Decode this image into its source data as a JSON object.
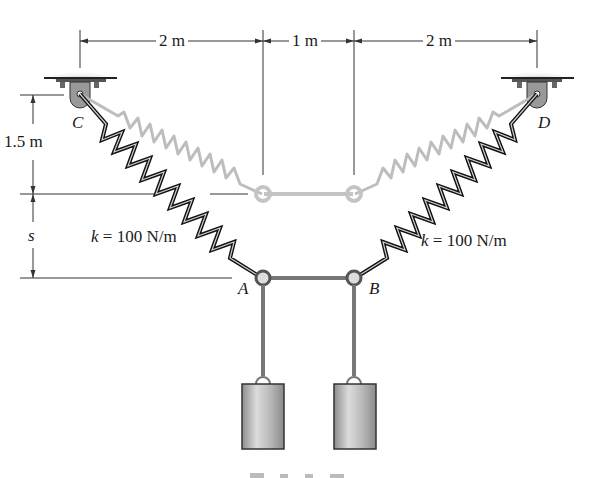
{
  "figure": {
    "dimensions": {
      "top_left": "2 m",
      "top_middle": "1 m",
      "top_right": "2 m",
      "left_vertical_upper": "1.5 m",
      "left_vertical_lower": "s"
    },
    "supports": {
      "left": "C",
      "right": "D"
    },
    "joints": {
      "left": "A",
      "right": "B"
    },
    "springs": {
      "left_label_k": "k",
      "left_label_value": "= 100 N/m",
      "right_label_k": "k",
      "right_label_value": "= 100 N/m"
    },
    "colors": {
      "spring_dark": "#111111",
      "spring_ghost": "#bbbbbb",
      "block_fill": "#b8b8b8",
      "ceiling": "#9a9a9a",
      "dimension_line": "#333333"
    }
  }
}
